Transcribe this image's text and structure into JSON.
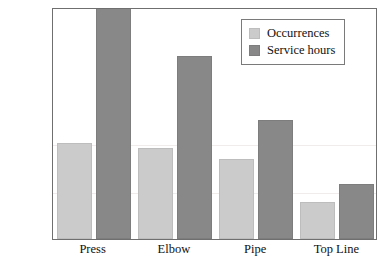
{
  "chart_data": {
    "type": "bar",
    "title": "",
    "xlabel": "",
    "ylabel": "",
    "categories": [
      "Press",
      "Elbow",
      "Pipe",
      "Top Line"
    ],
    "series": [
      {
        "name": "Occurrences",
        "color": "#cbcbcb",
        "values": [
          498,
          475,
          415,
          190
        ]
      },
      {
        "name": "Service hours",
        "color": "#888888",
        "values": [
          1250,
          950,
          620,
          285
        ]
      }
    ],
    "ylim": [
      0,
      1205
    ],
    "ytick_step": 83,
    "ytick_labels": [
      "0",
      "83",
      "166",
      "249",
      "332",
      "415",
      "498",
      "581",
      "664",
      "747",
      "830",
      "913",
      "996",
      "1079",
      "1162"
    ],
    "ytick_values": [
      0,
      83,
      166,
      249,
      332,
      415,
      498,
      581,
      664,
      747,
      830,
      913,
      996,
      1079,
      1162
    ],
    "grid": false,
    "legend_position": "top-right"
  },
  "legend": {
    "entries": [
      {
        "label": "Occurrences"
      },
      {
        "label": "Service hours"
      }
    ]
  }
}
